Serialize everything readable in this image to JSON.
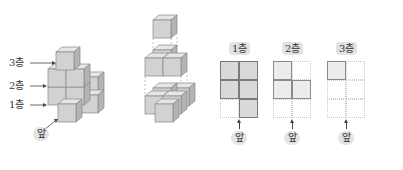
{
  "figure": {
    "left_stack": {
      "labels": [
        {
          "text": "3층"
        },
        {
          "text": "2층"
        },
        {
          "text": "1층"
        }
      ],
      "front_label": "앞"
    },
    "exploded_view": {
      "layers": [
        {
          "name": "3층",
          "cubes": 1
        },
        {
          "name": "2층",
          "cubes": 3
        },
        {
          "name": "1층",
          "cubes": 5
        }
      ]
    },
    "layer_plans": [
      {
        "title": "1층",
        "front_label": "앞",
        "cells": [
          [
            1,
            1
          ],
          [
            1,
            1
          ],
          [
            0,
            1
          ]
        ]
      },
      {
        "title": "2층",
        "front_label": "앞",
        "cells": [
          [
            1,
            0
          ],
          [
            1,
            1
          ],
          [
            0,
            0
          ]
        ]
      },
      {
        "title": "3층",
        "front_label": "앞",
        "cells": [
          [
            1,
            0
          ],
          [
            0,
            0
          ],
          [
            0,
            0
          ]
        ]
      }
    ]
  },
  "colors": {
    "cube_front": "#d2d2d2",
    "cube_top": "#e6e6e6",
    "cube_side": "#b4b4b4",
    "cube_edge": "#888888",
    "badge_bg": "#e2e2e2"
  }
}
